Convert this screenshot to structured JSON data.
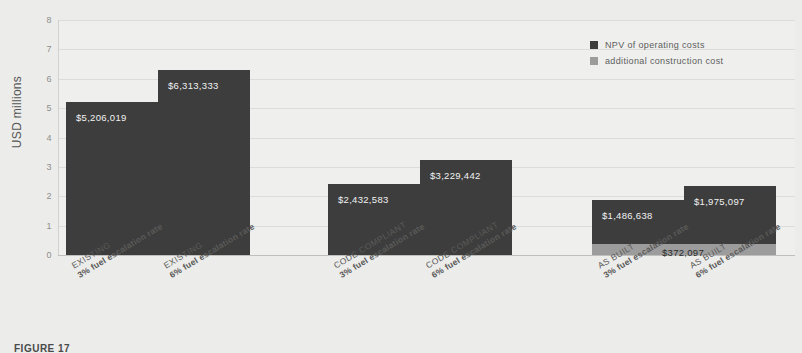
{
  "chart_data": {
    "type": "bar",
    "title": "",
    "xlabel": "",
    "ylabel": "USD millions",
    "ylim": [
      0,
      8
    ],
    "yticks": [
      "0",
      "1",
      "2",
      "3",
      "4",
      "5",
      "6",
      "7",
      "8"
    ],
    "grid": true,
    "legend_position": "top-right",
    "legend": [
      {
        "label": "NPV of operating costs",
        "color": "#3d3d3d"
      },
      {
        "label": "additional construction cost",
        "color": "#9c9c9c"
      }
    ],
    "categories": [
      {
        "group": "EXISTING",
        "rate": "3% fuel escalation rate"
      },
      {
        "group": "EXISTING",
        "rate": "6% fuel escalation rate"
      },
      {
        "group": "CODE COMPLIANT",
        "rate": "3% fuel escalation rate"
      },
      {
        "group": "CODE COMPLIANT",
        "rate": "6% fuel escalation rate"
      },
      {
        "group": "AS BUILT",
        "rate": "3% fuel escalation rate"
      },
      {
        "group": "AS BUILT",
        "rate": "6% fuel escalation rate"
      }
    ],
    "series": [
      {
        "name": "NPV of operating costs",
        "color": "#3d3d3d",
        "values": [
          5206019,
          6313333,
          2432583,
          3229442,
          1486638,
          1975097
        ],
        "labels": [
          "$5,206,019",
          "$6,313,333",
          "$2,432,583",
          "$3,229,442",
          "$1,486,638",
          "$1,975,097"
        ]
      },
      {
        "name": "additional construction cost",
        "color": "#9c9c9c",
        "values": [
          0,
          0,
          0,
          0,
          372097,
          372097
        ],
        "labels": [
          "",
          "",
          "",
          "",
          "$372,097",
          "$372,097"
        ]
      }
    ],
    "annotations": [
      {
        "text": "$372,097",
        "note": "shared label for additional construction cost band under AS BUILT group"
      }
    ]
  },
  "caption": {
    "text": "FIGURE 17"
  }
}
